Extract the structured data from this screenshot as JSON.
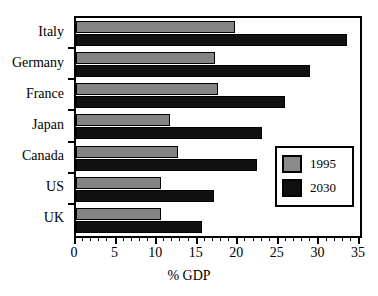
{
  "chart_data": {
    "type": "bar",
    "orientation": "horizontal",
    "title": "",
    "xlabel": "% GDP",
    "ylabel": "",
    "xlim": [
      0,
      35
    ],
    "ylim": null,
    "grid": false,
    "legend_position": "inside-right-middle",
    "categories": [
      "Italy",
      "Germany",
      "France",
      "Japan",
      "Canada",
      "US",
      "UK"
    ],
    "xticks": [
      0,
      5,
      10,
      15,
      20,
      25,
      30,
      35
    ],
    "xtick_labels": [
      "0",
      "5",
      "10",
      "15",
      "20",
      "25",
      "30",
      "35"
    ],
    "minor_tick_interval": 1,
    "series": [
      {
        "name": "1995",
        "color": "#848484",
        "values": [
          19.6,
          17.1,
          17.5,
          11.6,
          12.6,
          10.5,
          10.5
        ]
      },
      {
        "name": "2030",
        "color": "#111111",
        "values": [
          33.4,
          28.8,
          25.8,
          22.9,
          22.3,
          17.0,
          15.5
        ]
      }
    ]
  },
  "legend": {
    "entries": [
      {
        "label": "1995",
        "swatch": "gray-swatch"
      },
      {
        "label": "2030",
        "swatch": "black-swatch"
      }
    ]
  },
  "axis": {
    "x_title": "% GDP"
  }
}
